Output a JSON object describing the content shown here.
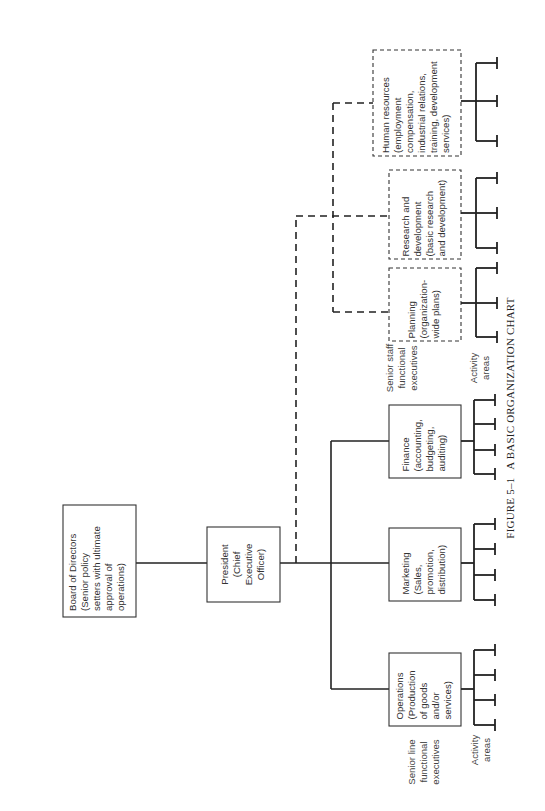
{
  "figure": {
    "caption_number": "FIGURE 5–1",
    "caption_title": "A BASIC ORGANIZATION CHART",
    "orientation": "rotated 90° clockwise (landscape chart on portrait page)"
  },
  "nodes": {
    "board": {
      "lines": [
        "Board of Directors",
        "(Senior policy",
        "setters with ultimate",
        "approval of",
        "operations)"
      ],
      "style": "solid"
    },
    "president": {
      "lines": [
        "President",
        "(Chief",
        "Executive",
        "Officer)"
      ],
      "style": "solid"
    },
    "line_executives": [
      {
        "id": "operations",
        "lines": [
          "Operations",
          "(Production",
          "of goods",
          "and/or",
          "services)"
        ],
        "activity_areas": 4
      },
      {
        "id": "marketing",
        "lines": [
          "Marketing",
          "(Sales,",
          "promotion,",
          "distribution)"
        ],
        "activity_areas": 4
      },
      {
        "id": "finance",
        "lines": [
          "Finance",
          "(accounting,",
          "budgeting,",
          "auditing)"
        ],
        "activity_areas": 4
      }
    ],
    "staff_executives": [
      {
        "id": "planning",
        "lines": [
          "Planning",
          "(organization-",
          "wide plans)"
        ],
        "activity_areas": 3
      },
      {
        "id": "research",
        "lines": [
          "Research and",
          "development",
          "(basic research",
          "and development)"
        ],
        "activity_areas": 3
      },
      {
        "id": "human_resources",
        "lines": [
          "Human resources",
          "(employment",
          "compensation,",
          "industrial relations,",
          "training, development",
          "services)"
        ],
        "activity_areas": 3
      }
    ]
  },
  "labels": {
    "senior_line": [
      "Senior line",
      "functional",
      "executives"
    ],
    "senior_staff": [
      "Senior staff",
      "functional",
      "executives"
    ],
    "activity_areas_line": [
      "Activity",
      "areas"
    ],
    "activity_areas_staff": [
      "Activity",
      "areas"
    ]
  },
  "legend": {
    "solid_line": "line authority",
    "dashed_line": "staff relationship"
  }
}
